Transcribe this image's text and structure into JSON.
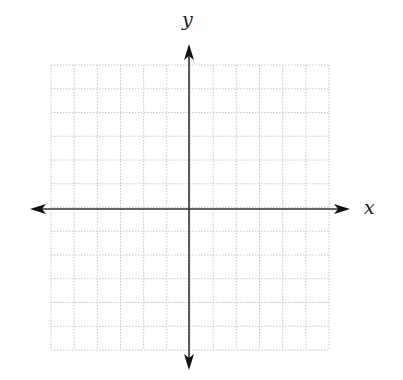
{
  "diagram": {
    "type": "coordinate-plane",
    "x_label": "x",
    "y_label": "y",
    "grid": {
      "columns": 12,
      "rows": 12,
      "left": 51,
      "top": 65,
      "right": 329,
      "bottom": 350,
      "line_color": "#c8c8c8",
      "line_style": "dotted"
    },
    "axes": {
      "origin_x": 189,
      "origin_y": 209,
      "x_min_px": 30,
      "x_max_px": 350,
      "y_min_px": 44,
      "y_max_px": 370,
      "color": "#333333"
    }
  }
}
